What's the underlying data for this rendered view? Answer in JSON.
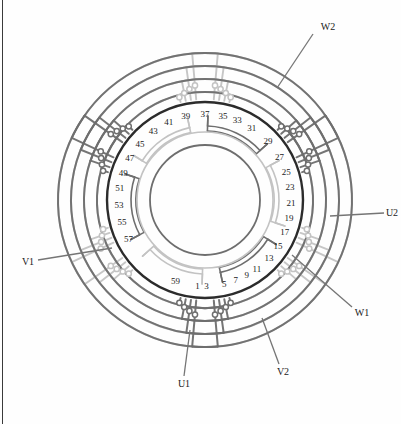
{
  "figure": {
    "type": "stator-winding-diagram",
    "slot_count": 60,
    "phases": 3,
    "geometry": {
      "center_x": 205,
      "center_y": 200,
      "bore_radius": 55,
      "inner_ring_radius": 68,
      "stator_radius": 98,
      "label_radius": 86,
      "coil_arc_radius": 74
    },
    "colors": {
      "stator_outline": "#2b2b2b",
      "coil_dark": "#6e6e6e",
      "coil_light": "#c3c3c3",
      "node_fill": "#ffffff",
      "text": "#1b1b1b",
      "frame": "#3a3a3a",
      "background": "#fefefe"
    }
  },
  "slot_labels": [
    {
      "id": "slot-1",
      "text": "1",
      "angle": 95
    },
    {
      "id": "slot-3",
      "text": "3",
      "angle": 89
    },
    {
      "id": "slot-5",
      "text": "5",
      "angle": 77
    },
    {
      "id": "slot-7",
      "text": "7",
      "angle": 69
    },
    {
      "id": "slot-9",
      "text": "9",
      "angle": 61
    },
    {
      "id": "slot-11",
      "text": "11",
      "angle": 53
    },
    {
      "id": "slot-13",
      "text": "13",
      "angle": 42
    },
    {
      "id": "slot-15",
      "text": "15",
      "angle": 32
    },
    {
      "id": "slot-17",
      "text": "17",
      "angle": 22
    },
    {
      "id": "slot-19",
      "text": "19",
      "angle": 12
    },
    {
      "id": "slot-21",
      "text": "21",
      "angle": 2
    },
    {
      "id": "slot-23",
      "text": "23",
      "angle": -9
    },
    {
      "id": "slot-25",
      "text": "25",
      "angle": -19
    },
    {
      "id": "slot-27",
      "text": "27",
      "angle": -30
    },
    {
      "id": "slot-29",
      "text": "29",
      "angle": -43
    },
    {
      "id": "slot-31",
      "text": "31",
      "angle": -57
    },
    {
      "id": "slot-33",
      "text": "33",
      "angle": -68
    },
    {
      "id": "slot-35",
      "text": "35",
      "angle": -78
    },
    {
      "id": "slot-37",
      "text": "37",
      "angle": -90
    },
    {
      "id": "slot-39",
      "text": "39",
      "angle": -103
    },
    {
      "id": "slot-41",
      "text": "41",
      "angle": -115
    },
    {
      "id": "slot-43",
      "text": "43",
      "angle": -127
    },
    {
      "id": "slot-45",
      "text": "45",
      "angle": -139
    },
    {
      "id": "slot-47",
      "text": "47",
      "angle": -151
    },
    {
      "id": "slot-49",
      "text": "49",
      "angle": -162
    },
    {
      "id": "slot-51",
      "text": "51",
      "angle": -172
    },
    {
      "id": "slot-53",
      "text": "53",
      "angle": 177
    },
    {
      "id": "slot-55",
      "text": "55",
      "angle": 165
    },
    {
      "id": "slot-57",
      "text": "57",
      "angle": 153
    },
    {
      "id": "slot-59",
      "text": "59",
      "angle": 110
    }
  ],
  "terminals": [
    {
      "id": "terminal-w2",
      "text": "W2",
      "x": 328,
      "y": 27,
      "leader": [
        313,
        34,
        277,
        88
      ]
    },
    {
      "id": "terminal-u2",
      "text": "U2",
      "x": 392,
      "y": 213,
      "leader": [
        384,
        213,
        330,
        216
      ]
    },
    {
      "id": "terminal-w1",
      "text": "W1",
      "x": 362,
      "y": 313,
      "leader": [
        352,
        307,
        292,
        255
      ]
    },
    {
      "id": "terminal-v2",
      "text": "V2",
      "x": 283,
      "y": 372,
      "leader": [
        279,
        364,
        262,
        318
      ]
    },
    {
      "id": "terminal-u1",
      "text": "U1",
      "x": 184,
      "y": 384,
      "leader": [
        184,
        376,
        190,
        330
      ]
    },
    {
      "id": "terminal-v1",
      "text": "V1",
      "x": 28,
      "y": 262,
      "leader": [
        38,
        260,
        112,
        248
      ]
    }
  ],
  "coil_groups": [
    {
      "id": "coil-group-u1",
      "phase": "U",
      "start_slot": 1,
      "tone": "light"
    },
    {
      "id": "coil-group-v2",
      "phase": "V",
      "start_slot": 11,
      "tone": "dark"
    },
    {
      "id": "coil-group-w1",
      "phase": "W",
      "start_slot": 21,
      "tone": "light"
    },
    {
      "id": "coil-group-u2",
      "phase": "U",
      "start_slot": 31,
      "tone": "dark"
    },
    {
      "id": "coil-group-v1",
      "phase": "V",
      "start_slot": 41,
      "tone": "light"
    },
    {
      "id": "coil-group-w2",
      "phase": "W",
      "start_slot": 51,
      "tone": "dark"
    }
  ],
  "end_turn_bundles": [
    {
      "id": "bundle-top",
      "center_angle": -90,
      "tone": "dark"
    },
    {
      "id": "bundle-upper-right",
      "center_angle": -30,
      "tone": "light"
    },
    {
      "id": "bundle-lower-right",
      "center_angle": 30,
      "tone": "dark"
    },
    {
      "id": "bundle-bottom",
      "center_angle": 90,
      "tone": "light"
    },
    {
      "id": "bundle-lower-left",
      "center_angle": 150,
      "tone": "dark"
    },
    {
      "id": "bundle-upper-left",
      "center_angle": -150,
      "tone": "light"
    }
  ]
}
